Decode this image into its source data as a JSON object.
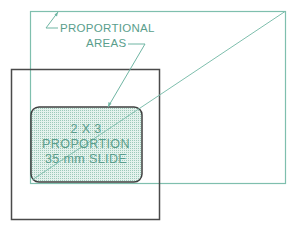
{
  "diagram": {
    "label": {
      "line1": "PROPORTIONAL",
      "line2": "AREAS"
    },
    "slide": {
      "line1": "2 X 3",
      "line2": "PROPORTION",
      "line3": "35 mm SLIDE"
    },
    "colors": {
      "accent": "#6fb5a3",
      "frame": "#4a4a4a",
      "slide_fill": "#d6ebe4",
      "text": "#5a9e8c"
    }
  }
}
